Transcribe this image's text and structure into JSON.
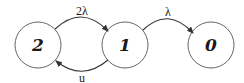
{
  "diagram": {
    "type": "state-transition",
    "nodes": [
      {
        "id": "2",
        "label": "2",
        "cx": 38,
        "cy": 45,
        "r": 23
      },
      {
        "id": "1",
        "label": "1",
        "cx": 125,
        "cy": 45,
        "r": 23
      },
      {
        "id": "0",
        "label": "0",
        "cx": 211,
        "cy": 45,
        "r": 23
      }
    ],
    "edges": [
      {
        "from": "2",
        "to": "1",
        "label": "2λ"
      },
      {
        "from": "1",
        "to": "2",
        "label": "u"
      },
      {
        "from": "1",
        "to": "0",
        "label": "λ"
      }
    ],
    "colors": {
      "stroke": "#555555",
      "text": "#1a1a1a",
      "background": "#ffffff"
    }
  }
}
